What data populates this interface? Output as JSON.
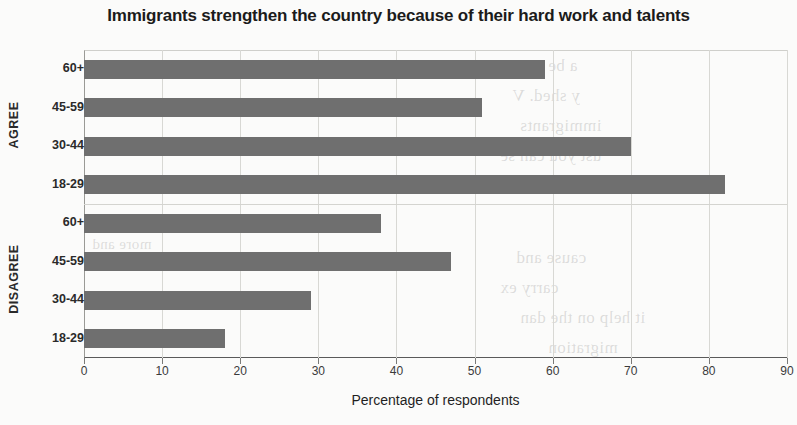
{
  "chart_data": {
    "type": "bar",
    "orientation": "horizontal",
    "title": "Immigrants strengthen the country because of their hard work and talents",
    "xlabel": "Percentage of respondents",
    "ylabel": "",
    "xlim": [
      0,
      90
    ],
    "xticks": [
      0,
      10,
      20,
      30,
      40,
      50,
      60,
      70,
      80,
      90
    ],
    "xtick_labels": [
      "0",
      "10",
      "20",
      "30",
      "40",
      "50",
      "60",
      "70",
      "80",
      "90"
    ],
    "grid": true,
    "grid_axis": "x",
    "legend": false,
    "bar_color": "#6f6f6f",
    "groups": [
      {
        "name": "AGREE",
        "categories": [
          "60+",
          "45-59",
          "30-44",
          "18-29"
        ],
        "values": [
          59,
          51,
          70,
          82
        ]
      },
      {
        "name": "DISAGREE",
        "categories": [
          "60+",
          "45-59",
          "30-44",
          "18-29"
        ],
        "values": [
          38,
          47,
          29,
          18
        ]
      }
    ],
    "bars": [
      {
        "group": "AGREE",
        "category": "60+",
        "value": 59
      },
      {
        "group": "AGREE",
        "category": "45-59",
        "value": 51
      },
      {
        "group": "AGREE",
        "category": "30-44",
        "value": 70
      },
      {
        "group": "AGREE",
        "category": "18-29",
        "value": 82
      },
      {
        "group": "DISAGREE",
        "category": "60+",
        "value": 38
      },
      {
        "group": "DISAGREE",
        "category": "45-59",
        "value": 47
      },
      {
        "group": "DISAGREE",
        "category": "30-44",
        "value": 29
      },
      {
        "group": "DISAGREE",
        "category": "18-29",
        "value": 18
      }
    ]
  },
  "background_bleed": [
    "a be",
    "y shed. V",
    "immigrants",
    "ust you can se",
    "standard and",
    "cause and",
    "carry ex",
    "it help on the dan",
    "migration",
    "more and"
  ]
}
